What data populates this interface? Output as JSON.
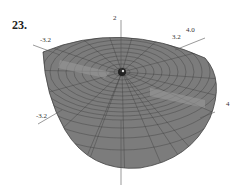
{
  "figure": {
    "number": "23.",
    "axis_labels": {
      "z_top": "2",
      "y_upper_right_outer": "4.0",
      "y_upper_right_inner": "3.2",
      "x_upper_left": "-3.2",
      "x_lower_left": "-3.2",
      "right_side": "4"
    },
    "colors": {
      "surface": "#7a7a7a",
      "mesh": "#3a3a3a",
      "axis": "#555555"
    }
  }
}
